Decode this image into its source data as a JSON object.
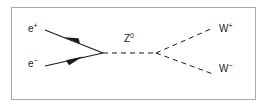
{
  "figure": {
    "background_color": "#ffffff",
    "border_color": "#a9a9a9",
    "line_color": "#1a1a1a"
  },
  "diagram_data": {
    "type": "feynman-diagram",
    "process": "e+ e- -> Z0 -> W+ W-",
    "vertices": [
      {
        "name": "left-vertex",
        "x": 103,
        "y": 53
      },
      {
        "name": "right-vertex",
        "x": 156,
        "y": 53
      }
    ],
    "lines": [
      {
        "name": "positron-line",
        "particle": "e+",
        "style": "solid",
        "arrow": "toward-label",
        "from": {
          "x": 45,
          "y": 30
        },
        "to": {
          "x": 103,
          "y": 53
        },
        "arrow_at": {
          "x": 73,
          "y": 41
        }
      },
      {
        "name": "electron-line",
        "particle": "e-",
        "style": "solid",
        "arrow": "toward-vertex",
        "from": {
          "x": 45,
          "y": 66
        },
        "to": {
          "x": 103,
          "y": 53
        },
        "arrow_at": {
          "x": 74,
          "y": 59
        }
      },
      {
        "name": "z-propagator",
        "particle": "Z0",
        "style": "dashed",
        "arrow": "none",
        "from": {
          "x": 103,
          "y": 53
        },
        "to": {
          "x": 156,
          "y": 53
        }
      },
      {
        "name": "w-plus-line",
        "particle": "W+",
        "style": "dashed",
        "arrow": "none",
        "from": {
          "x": 156,
          "y": 53
        },
        "to": {
          "x": 213,
          "y": 28
        }
      },
      {
        "name": "w-minus-line",
        "particle": "W-",
        "style": "dashed",
        "arrow": "none",
        "from": {
          "x": 156,
          "y": 53
        },
        "to": {
          "x": 213,
          "y": 74
        }
      }
    ],
    "labels": [
      {
        "name": "positron-label",
        "base": "e",
        "charge": "+",
        "x": 28,
        "y": 24
      },
      {
        "name": "electron-label",
        "base": "e",
        "charge": "−",
        "x": 28,
        "y": 59
      },
      {
        "name": "z-boson-label",
        "base": "Z",
        "charge": "0",
        "x": 124,
        "y": 34
      },
      {
        "name": "w-plus-label",
        "base": "W",
        "charge": "+",
        "x": 219,
        "y": 24
      },
      {
        "name": "w-minus-label",
        "base": "W",
        "charge": "−",
        "x": 219,
        "y": 64
      }
    ]
  },
  "labels": {
    "positron": {
      "base": "e",
      "charge": "+"
    },
    "electron": {
      "base": "e",
      "charge": "−"
    },
    "z_boson": {
      "base": "Z",
      "charge": "0"
    },
    "w_plus": {
      "base": "W",
      "charge": "+"
    },
    "w_minus": {
      "base": "W",
      "charge": "−"
    }
  }
}
